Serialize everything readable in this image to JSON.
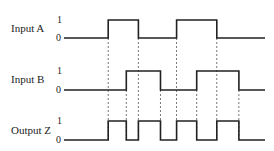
{
  "time_range": [
    0,
    10
  ],
  "level_labels": {
    "high": "1",
    "low": "0"
  },
  "signals": [
    {
      "id": "input-a",
      "label": "Input A",
      "initial": 0,
      "transitions": [
        2.2,
        3.7,
        5.6,
        7.6
      ]
    },
    {
      "id": "input-b",
      "label": "Input B",
      "initial": 0,
      "transitions": [
        3.1,
        4.8,
        6.6,
        8.7
      ]
    },
    {
      "id": "output-z",
      "label": "Output Z",
      "initial": 0,
      "transitions": [
        2.2,
        3.1,
        3.7,
        4.8,
        5.6,
        6.6,
        7.6,
        8.7
      ]
    }
  ],
  "relationship": "Z = A XOR B"
}
